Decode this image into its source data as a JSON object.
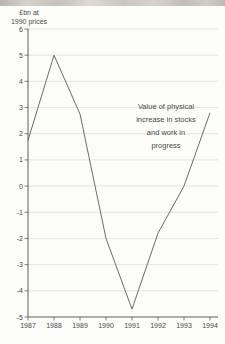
{
  "figure": {
    "unit_label_line1": "£bn at",
    "unit_label_line2": "1990 prices",
    "annotation_text": "Value of physical\nincrease in stocks\nand work in\nprogress"
  },
  "chart_data": {
    "type": "line",
    "title": "",
    "unit": "£bn at 1990 prices",
    "categories": [
      "1987",
      "1988",
      "1989",
      "1990",
      "1991",
      "1992",
      "1993",
      "1994"
    ],
    "values": [
      1.75,
      5.0,
      2.75,
      -2.0,
      -4.7,
      -1.8,
      0.0,
      2.8
    ],
    "series_name": "Value of physical increase in stocks and work in progress",
    "xlabel": "",
    "ylabel": "£bn at 1990 prices",
    "ylim": [
      -5,
      6
    ],
    "y_ticks": [
      6,
      5,
      4,
      3,
      2,
      1,
      0,
      -1,
      -2,
      -3,
      -4,
      -5
    ],
    "grid": true,
    "legend_position": "annotation-center-right",
    "colors": {
      "line": "#6b6b6b",
      "axis": "#5f5f5f",
      "grid": "#dddddb",
      "text": "#4a4a4a"
    }
  }
}
